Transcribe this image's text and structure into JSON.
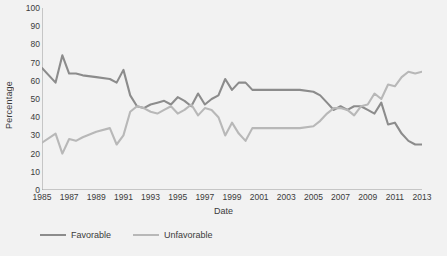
{
  "chart_data": {
    "type": "line",
    "title": "",
    "xlabel": "Date",
    "ylabel": "Percentage",
    "xlim": [
      1985,
      2013
    ],
    "ylim": [
      0,
      100
    ],
    "grid": false,
    "legend_position": "bottom-left",
    "y_ticks": [
      0,
      10,
      20,
      30,
      40,
      50,
      60,
      70,
      80,
      90,
      100
    ],
    "x_ticks": [
      1985,
      1987,
      1989,
      1991,
      1993,
      1995,
      1997,
      1999,
      2001,
      2003,
      2005,
      2007,
      2009,
      2011,
      2013
    ],
    "x": [
      1985,
      1986,
      1986.5,
      1987,
      1987.5,
      1988,
      1989,
      1990,
      1990.5,
      1991,
      1991.5,
      1992,
      1992.5,
      1993,
      1993.5,
      1994,
      1994.5,
      1995,
      1995.5,
      1996,
      1996.5,
      1997,
      1997.5,
      1998,
      1998.5,
      1999,
      1999.5,
      2000,
      2000.5,
      2001,
      2002,
      2003,
      2004,
      2005,
      2005.5,
      2006,
      2006.5,
      2007,
      2007.5,
      2008,
      2008.5,
      2009,
      2009.5,
      2010,
      2010.5,
      2011,
      2011.5,
      2012,
      2012.5,
      2013
    ],
    "series": [
      {
        "name": "Favorable",
        "color": "#8c8c8c",
        "values": [
          67,
          59,
          74,
          64,
          64,
          63,
          62,
          61,
          59,
          66,
          52,
          46,
          45,
          47,
          48,
          49,
          47,
          51,
          49,
          46,
          53,
          47,
          50,
          52,
          61,
          55,
          59,
          59,
          55,
          55,
          55,
          55,
          55,
          54,
          52,
          48,
          44,
          46,
          44,
          46,
          46,
          44,
          42,
          48,
          36,
          37,
          31,
          27,
          25,
          25
        ]
      },
      {
        "name": "Unfavorable",
        "color": "#b8b8b8",
        "values": [
          26,
          31,
          20,
          28,
          27,
          29,
          32,
          34,
          25,
          30,
          43,
          46,
          45,
          43,
          42,
          44,
          46,
          42,
          44,
          47,
          41,
          45,
          44,
          40,
          30,
          37,
          31,
          27,
          34,
          34,
          34,
          34,
          34,
          35,
          38,
          42,
          45,
          45,
          44,
          41,
          46,
          47,
          53,
          50,
          58,
          57,
          62,
          65,
          64,
          65
        ]
      }
    ]
  },
  "axis_titles": {
    "x": "Date",
    "y": "Percentage"
  },
  "legend": [
    {
      "label": "Favorable",
      "color": "#8c8c8c"
    },
    {
      "label": "Unfavorable",
      "color": "#b8b8b8"
    }
  ]
}
